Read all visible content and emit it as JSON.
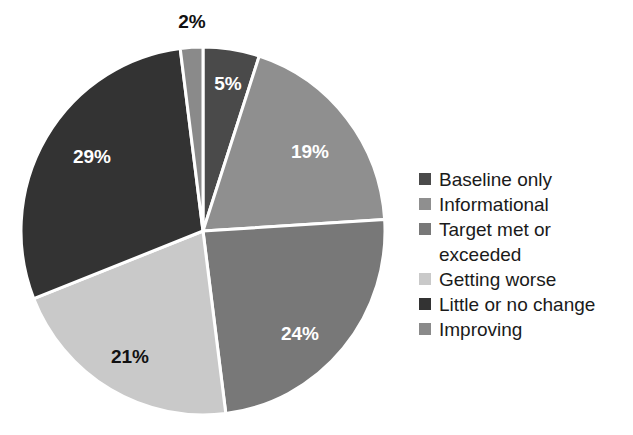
{
  "chart_data": {
    "type": "pie",
    "title": "",
    "subtitle": "",
    "xlabel": "",
    "ylabel": "",
    "legend_position": "right",
    "grid": false,
    "units": "percent",
    "total": 100,
    "categories": [
      "Baseline only",
      "Informational",
      "Target met or exceeded",
      "Getting worse",
      "Little or no change",
      "Improving"
    ],
    "values": [
      5,
      19,
      24,
      21,
      29,
      2
    ],
    "labels": [
      "5%",
      "19%",
      "24%",
      "21%",
      "29%",
      "2%"
    ],
    "colors": [
      "#4a4a4a",
      "#8f8f8f",
      "#787878",
      "#c9c9c9",
      "#333333",
      "#8a8a8a"
    ],
    "slices": [
      {
        "name": "Baseline only",
        "value": 5,
        "label": "5%",
        "color": "#4a4a4a",
        "label_color": "#ffffff",
        "start_angle": 0,
        "end_angle": 18,
        "label_x": 228,
        "label_y": 90
      },
      {
        "name": "Informational",
        "value": 19,
        "label": "19%",
        "color": "#8f8f8f",
        "label_color": "#ffffff",
        "start_angle": 18,
        "end_angle": 86.4,
        "label_x": 310,
        "label_y": 158
      },
      {
        "name": "Target met or exceeded",
        "value": 24,
        "label": "24%",
        "color": "#787878",
        "label_color": "#ffffff",
        "start_angle": 86.4,
        "end_angle": 172.8,
        "label_x": 300,
        "label_y": 340
      },
      {
        "name": "Getting worse",
        "value": 21,
        "label": "21%",
        "color": "#c9c9c9",
        "label_color": "#111111",
        "start_angle": 172.8,
        "end_angle": 248.4,
        "label_x": 130,
        "label_y": 363
      },
      {
        "name": "Little or no change",
        "value": 29,
        "label": "29%",
        "color": "#333333",
        "label_color": "#ffffff",
        "start_angle": 248.4,
        "end_angle": 352.8,
        "label_x": 92,
        "label_y": 163
      },
      {
        "name": "Improving",
        "value": 2,
        "label": "2%",
        "color": "#8a8a8a",
        "label_color": "#111111",
        "start_angle": 352.8,
        "end_angle": 360,
        "label_x": 192,
        "label_y": 28
      }
    ],
    "geometry": {
      "center_x": 203,
      "center_y": 231,
      "radius_x": 182,
      "radius_y": 184,
      "separator_color": "#ffffff",
      "separator_width": 3
    }
  },
  "legend": {
    "items": [
      {
        "label": "Baseline only",
        "color": "#4a4a4a",
        "wrapped": false,
        "line2": ""
      },
      {
        "label": "Informational",
        "color": "#8f8f8f",
        "wrapped": false,
        "line2": ""
      },
      {
        "label": "Target met or",
        "color": "#787878",
        "wrapped": true,
        "line2": "exceeded"
      },
      {
        "label": "Getting worse",
        "color": "#c9c9c9",
        "wrapped": false,
        "line2": ""
      },
      {
        "label": "Little or no change",
        "color": "#333333",
        "wrapped": false,
        "line2": ""
      },
      {
        "label": "Improving",
        "color": "#8a8a8a",
        "wrapped": false,
        "line2": ""
      }
    ]
  }
}
